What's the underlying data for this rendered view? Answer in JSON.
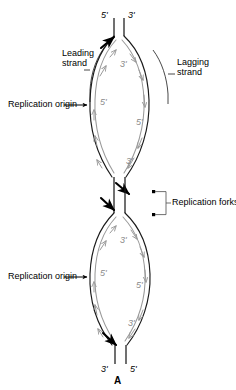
{
  "figure": {
    "panel_letter": "A",
    "colors": {
      "parental_strand": "#1a1a1a",
      "daughter_strand": "#9a9a9a",
      "label_text": "#000000",
      "gray_label_text": "#8a8a8a",
      "background": "#ffffff"
    }
  },
  "terminal_labels": {
    "top_left": "5'",
    "top_right": "3'",
    "bottom_left": "3'",
    "bottom_right": "5'"
  },
  "annotations": {
    "leading_strand": {
      "line1": "Leading",
      "line2": "strand"
    },
    "lagging_strand": {
      "line1": "Lagging",
      "line2": "strand"
    },
    "replication_origin_upper": "Replication origin",
    "replication_origin_lower": "Replication origin",
    "replication_forks": "Replication forks"
  },
  "upper_bubble": {
    "inner_labels": {
      "top_left_3prime": "3'",
      "left_5prime": "5'",
      "right_5prime": "5'",
      "bottom_right_3prime": "3'"
    }
  },
  "lower_bubble": {
    "inner_labels": {
      "top_left_3prime": "3'",
      "left_5prime": "5'",
      "right_5prime": "5'",
      "bottom_right_3prime": "3'"
    }
  }
}
